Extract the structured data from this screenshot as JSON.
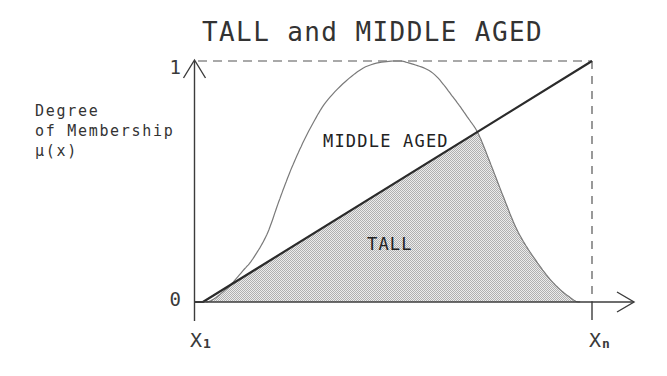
{
  "chart_data": {
    "type": "area",
    "title": "TALL and MIDDLE AGED",
    "xlabel": "",
    "ylabel": "Degree of Membership μ(x)",
    "ylabel_lines": [
      "Degree",
      "of Membership",
      "μ(x)"
    ],
    "xlim": [
      0,
      1
    ],
    "ylim": [
      0,
      1
    ],
    "grid": false,
    "legend": "none",
    "x_ticks": [
      {
        "value": 0,
        "label": "X",
        "subscript": "1"
      },
      {
        "value": 1,
        "label": "X",
        "subscript": "n"
      }
    ],
    "y_ticks": [
      {
        "value": 0,
        "label": "0"
      },
      {
        "value": 1,
        "label": "1"
      }
    ],
    "series": [
      {
        "name": "TALL",
        "kind": "line",
        "x": [
          0,
          0.02,
          1
        ],
        "y": [
          0,
          0,
          1
        ]
      },
      {
        "name": "MIDDLE AGED",
        "kind": "smooth-curve",
        "x": [
          0.028,
          0.045,
          0.083,
          0.121,
          0.146,
          0.181,
          0.214,
          0.247,
          0.29,
          0.34,
          0.423,
          0.499,
          0.542,
          0.599,
          0.65,
          0.685,
          0.713,
          0.743,
          0.776,
          0.811,
          0.851,
          0.902,
          0.952,
          0.97
        ],
        "y": [
          0.0,
          0.01,
          0.06,
          0.13,
          0.18,
          0.28,
          0.43,
          0.57,
          0.72,
          0.85,
          0.97,
          1.0,
          0.99,
          0.95,
          0.85,
          0.77,
          0.7,
          0.58,
          0.44,
          0.3,
          0.19,
          0.08,
          0.01,
          0.0
        ]
      }
    ],
    "shaded_region": {
      "rule": "min(TALL, MIDDLE AGED)",
      "description": "intersection: TALL and MIDDLE AGED"
    },
    "reference_lines": [
      {
        "orientation": "horizontal",
        "value": 1,
        "style": "dashed"
      },
      {
        "orientation": "vertical",
        "value": 1,
        "style": "dashed"
      }
    ],
    "annotations": [
      {
        "text": "MIDDLE AGED",
        "refers_to": "MIDDLE AGED"
      },
      {
        "text": "TALL",
        "refers_to": "TALL"
      }
    ],
    "colors": {
      "tall_line": "#2b2b2b",
      "middle_aged_curve": "#7a7a7a",
      "shading_dots": "#b0b0b0",
      "shading_base": "#ececec"
    }
  }
}
